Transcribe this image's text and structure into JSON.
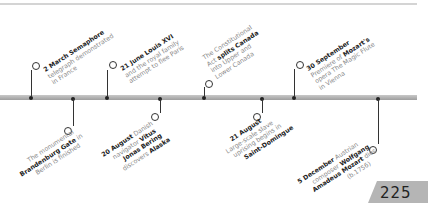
{
  "page": {
    "number": "225"
  },
  "timeline": {
    "events_above": [
      {
        "id": "semaphore",
        "date": "2 March",
        "bold_lead": "Semaphore",
        "text": "telegraph demonstrated",
        "text2": "in France",
        "x": 31
      },
      {
        "id": "louis",
        "date": "21 June",
        "bold_lead": "Louis XVI",
        "text": "and the royal family",
        "text2": "attempt to flee Paris",
        "x": 107
      },
      {
        "id": "canada",
        "pre": "The Constitutional",
        "line2_pre": "Act ",
        "bold": "splits Canada",
        "text": "into Upper and",
        "text2": "Lower Canada",
        "x": 204
      },
      {
        "id": "mozart-opera",
        "date": "30 September",
        "line2_pre": "Premiere of ",
        "bold": "Mozart's",
        "text": "opera The Magic Flute",
        "text2": "in Vienna",
        "x": 294
      }
    ],
    "events_below": [
      {
        "id": "brandenburg",
        "line1": "The monumental",
        "bold": "Brandenburg Gate",
        "line2_post": " in",
        "line3": "Berlin is finished",
        "x": 73
      },
      {
        "id": "bering",
        "date": "20 August",
        "line1_post": " Danish",
        "line2_pre": "navigator ",
        "bold1": "Vitus",
        "bold2": "Jonas Bering",
        "line4_pre": "discovers ",
        "bold3": "Alaska",
        "x": 160
      },
      {
        "id": "saint-domingue",
        "date": "21 August",
        "line2": "Large-scale slave",
        "line3": "uprising begins in",
        "bold": "Saint-Domingue",
        "x": 262
      },
      {
        "id": "mozart-death",
        "date": "5 December",
        "line1_post": " Austrian",
        "line2_pre": "composer ",
        "bold1": "Wolfgang",
        "bold2": "Amadeus Mozart",
        "line3_post": " dies",
        "line4": "(b.1756)",
        "x": 378
      }
    ]
  }
}
